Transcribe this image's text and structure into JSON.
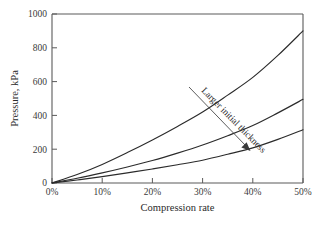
{
  "chart_data": {
    "type": "line",
    "title": "",
    "xlabel": "Compression rate",
    "ylabel": "Pressure, kPa",
    "xlim": [
      0,
      50
    ],
    "ylim": [
      0,
      1000
    ],
    "grid": false,
    "legend": "none",
    "x_tick_labels": [
      "0%",
      "10%",
      "20%",
      "30%",
      "40%",
      "50%"
    ],
    "x_tick_values": [
      0,
      10,
      20,
      30,
      40,
      50
    ],
    "y_tick_labels": [
      "0",
      "200",
      "400",
      "600",
      "800",
      "1000"
    ],
    "y_tick_values": [
      0,
      200,
      400,
      600,
      800,
      1000
    ],
    "x": [
      0,
      5,
      10,
      15,
      20,
      25,
      30,
      35,
      40,
      45,
      50
    ],
    "series": [
      {
        "name": "largest initial thickness",
        "values": [
          0,
          50,
          110,
          180,
          255,
          335,
          420,
          520,
          625,
          755,
          900
        ]
      },
      {
        "name": "medium initial thickness",
        "values": [
          0,
          28,
          60,
          95,
          133,
          177,
          225,
          280,
          340,
          415,
          495
        ]
      },
      {
        "name": "smallest initial thickness",
        "values": [
          0,
          18,
          38,
          60,
          83,
          108,
          135,
          170,
          208,
          258,
          315
        ]
      }
    ],
    "annotations": [
      {
        "text": "Larger initial thickness",
        "kind": "arrow-label",
        "direction": "down-right"
      }
    ]
  },
  "colors": {
    "background": "#ffffff",
    "axis": "#5a5a5a",
    "curve": "#2b2b2b",
    "text": "#2b2b2b",
    "annotation": "#3a3a3a"
  }
}
